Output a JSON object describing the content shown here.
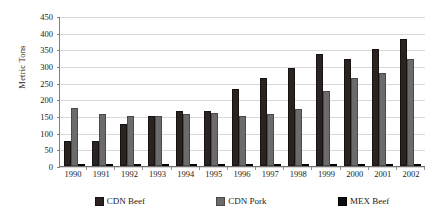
{
  "chart_data": {
    "type": "bar",
    "title": "",
    "xlabel": "",
    "ylabel": "Metric Tons",
    "ylim": [
      0,
      450
    ],
    "ytick_step": 50,
    "yticks": [
      450,
      400,
      350,
      300,
      250,
      200,
      150,
      100,
      50,
      0
    ],
    "grid": true,
    "legend_position": "bottom",
    "categories": [
      "1990",
      "1991",
      "1992",
      "1993",
      "1994",
      "1995",
      "1996",
      "1997",
      "1998",
      "1999",
      "2000",
      "2001",
      "2002"
    ],
    "series": [
      {
        "name": "CDN Beef",
        "color": "#2b2320",
        "values": [
          75,
          75,
          125,
          150,
          165,
          165,
          230,
          265,
          295,
          335,
          320,
          350,
          380
        ]
      },
      {
        "name": "CDN Pork",
        "color": "#6b6b6b",
        "values": [
          175,
          155,
          150,
          150,
          155,
          160,
          150,
          155,
          170,
          225,
          265,
          280,
          320
        ]
      },
      {
        "name": "MEX Beef",
        "color": "#0d0d0d",
        "values": [
          2,
          2,
          2,
          2,
          2,
          2,
          2,
          3,
          3,
          4,
          4,
          5,
          5
        ]
      }
    ]
  }
}
